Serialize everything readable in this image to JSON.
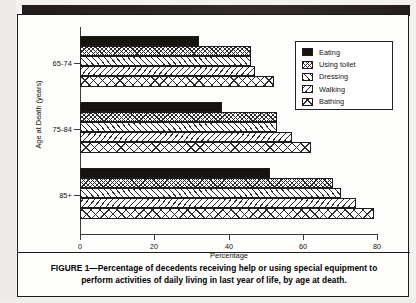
{
  "figure": {
    "caption_label": "FIGURE 1",
    "caption_dash": "—",
    "caption_text": "Percentage of decedents receiving help or using special equipment to perform activities of daily living in last year of life, by age at death."
  },
  "chart_data": {
    "type": "bar",
    "orientation": "horizontal",
    "title": "",
    "xlabel": "Percentage",
    "ylabel": "Age at Death (years)",
    "categories": [
      "65-74",
      "75-84",
      "85+"
    ],
    "xticks": [
      "0",
      "20",
      "40",
      "60",
      "80"
    ],
    "xlim": [
      0,
      80
    ],
    "grid": false,
    "legend_position": "top-right",
    "series": [
      {
        "name": "Eating",
        "pattern": "solid-black",
        "values": [
          32,
          38,
          51
        ]
      },
      {
        "name": "Using toilet",
        "pattern": "cross-dot",
        "values": [
          46,
          53,
          68
        ]
      },
      {
        "name": "Dressing",
        "pattern": "diagonal-up",
        "values": [
          46,
          53,
          70
        ]
      },
      {
        "name": "Walking",
        "pattern": "diagonal-down",
        "values": [
          47,
          57,
          74
        ]
      },
      {
        "name": "Bathing",
        "pattern": "x-hatch",
        "values": [
          52,
          62,
          79
        ]
      }
    ]
  }
}
